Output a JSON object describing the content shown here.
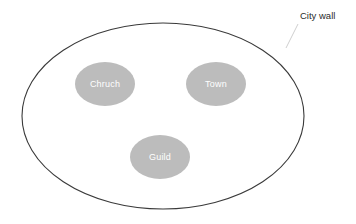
{
  "diagram": {
    "type": "venn-like-containment",
    "background_color": "#ffffff",
    "title": "",
    "outer_region": {
      "name": "city-wall",
      "shape": "ellipse",
      "label": "City wall",
      "label_position": "outside-top-right",
      "stroke_color": "#3a3a3a",
      "fill_color": "none",
      "stroke_width": 1.1,
      "center": {
        "cx": 163,
        "cy": 116
      },
      "radii": {
        "rx": 141,
        "ry": 93
      }
    },
    "callout": {
      "name": "city-wall-leader-line",
      "stroke_color": "#cfcfcf",
      "stroke_width": 1,
      "from": {
        "x": 298,
        "y": 24
      },
      "to": {
        "x": 286,
        "y": 48
      }
    },
    "nodes": [
      {
        "name": "church",
        "label": "Chruch",
        "shape": "ellipse",
        "fill_color": "#bcbcbc",
        "text_color": "#ffffff",
        "center": {
          "cx": 105,
          "cy": 84
        },
        "radii": {
          "rx": 30,
          "ry": 22
        }
      },
      {
        "name": "town",
        "label": "Town",
        "shape": "ellipse",
        "fill_color": "#bcbcbc",
        "text_color": "#ffffff",
        "center": {
          "cx": 216,
          "cy": 84
        },
        "radii": {
          "rx": 30,
          "ry": 22
        }
      },
      {
        "name": "guild",
        "label": "Guild",
        "shape": "ellipse",
        "fill_color": "#bcbcbc",
        "text_color": "#ffffff",
        "center": {
          "cx": 160,
          "cy": 157
        },
        "radii": {
          "rx": 30,
          "ry": 22
        }
      }
    ]
  }
}
